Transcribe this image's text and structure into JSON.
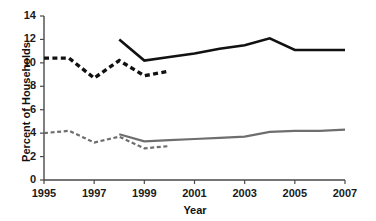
{
  "chart_data": {
    "type": "line",
    "title": "",
    "subtitle": "",
    "xlabel": "Year",
    "ylabel": "Percent of Households",
    "xlim": [
      1995,
      2007
    ],
    "ylim": [
      0,
      14
    ],
    "xticks": [
      1995,
      1997,
      1999,
      2001,
      2003,
      2005,
      2007
    ],
    "xtick_labels": [
      "1995",
      "1997",
      "1999",
      "2001",
      "2003",
      "2005",
      "2007"
    ],
    "yticks": [
      0,
      2,
      4,
      6,
      8,
      10,
      12,
      14
    ],
    "ytick_labels": [
      "0",
      "2",
      "4",
      "6",
      "8",
      "10",
      "12",
      "14"
    ],
    "grid": false,
    "legend": "none",
    "series": [
      {
        "name": "food-insecurity-old-methodology",
        "style": "dashed",
        "color": "#111111",
        "width": 3.4,
        "x": [
          1995,
          1996,
          1997,
          1998,
          1999,
          2000
        ],
        "values": [
          10.4,
          10.4,
          8.7,
          10.2,
          8.9,
          9.3
        ]
      },
      {
        "name": "food-insecurity-current-methodology",
        "style": "solid",
        "color": "#111111",
        "width": 2.6,
        "x": [
          1998,
          1999,
          2000,
          2001,
          2002,
          2003,
          2004,
          2005,
          2006,
          2007
        ],
        "values": [
          12.0,
          10.2,
          10.5,
          10.8,
          11.2,
          11.5,
          12.1,
          11.1,
          11.1,
          11.1
        ]
      },
      {
        "name": "very-low-food-security-old-methodology",
        "style": "dashed",
        "color": "#6e6e6e",
        "width": 2.2,
        "x": [
          1995,
          1996,
          1997,
          1998,
          1999,
          2000
        ],
        "values": [
          4.0,
          4.2,
          3.2,
          3.7,
          2.7,
          2.9
        ]
      },
      {
        "name": "very-low-food-security-current-methodology",
        "style": "solid",
        "color": "#6e6e6e",
        "width": 2.2,
        "x": [
          1998,
          1999,
          2000,
          2001,
          2002,
          2003,
          2004,
          2005,
          2006,
          2007
        ],
        "values": [
          3.9,
          3.3,
          3.4,
          3.5,
          3.6,
          3.7,
          4.1,
          4.2,
          4.2,
          4.3
        ]
      }
    ]
  },
  "axes": {
    "y_title": "Percent of Households",
    "x_title": "Year"
  }
}
